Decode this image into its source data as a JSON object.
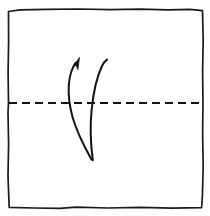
{
  "diagram": {
    "title": "Origami valley fold step",
    "type": "origami-fold-instruction",
    "canvas": {
      "width": 210,
      "height": 216,
      "background_color": "#ffffff"
    },
    "ink_color": "#141414",
    "paper": {
      "name": "square-sheet",
      "description": "Hand-drawn square sheet of paper",
      "fill_color": "#ffffff",
      "stroke_color": "#1a1a1a",
      "stroke_width": 1.7,
      "outline_path": "M 8.5 11.5 L 20 9.8 L 46 9.4 L 78 9.0 L 110 9.6 L 140 9.2 L 168 9.8 L 190 9.4 L 202.5 10.6 L 203.2 40 L 202.6 72 L 203.0 103 L 202.6 134 L 203.2 166 L 202.4 196 L 201.6 207.6 L 172 208.2 L 140 207.4 L 108 208.0 L 76 207.2 L 60 208.4 L 34 208.0 L 9.2 207.4 L 8.0 176 L 8.6 144 L 8.0 112 L 8.5 103 L 8.1 72 L 8.6 42 L 8.5 11.5 Z"
    },
    "crease": {
      "name": "horizontal-fold-crease",
      "style": "dashed",
      "description": "Dashed horizontal crease line marking the fold axis",
      "y_position": 103,
      "x_start": 9,
      "x_end": 203,
      "dash_length": 8,
      "gap_length": 5,
      "stroke_color": "#141414",
      "stroke_width": 1.9
    },
    "arrows": [
      {
        "name": "fold-arrow-left",
        "description": "Curved arrow sweeping upward with arrowhead indicating fold direction",
        "has_arrowhead": true,
        "stroke_width": 2.0,
        "path": "M 91.5 159.5 C 84 146 76.5 131 72.5 117 C 69.5 106 68.2 95 68.8 85 C 69.4 76 71.8 68.5 75.6 62.8",
        "arrowhead_points": "79.6 57.2 73.0 66.4 76.2 65.4 77.9 69.9",
        "tip": {
          "x": 79.6,
          "y": 57.2
        },
        "tail": {
          "x": 91.5,
          "y": 159.5
        }
      },
      {
        "name": "fold-arrow-right",
        "description": "Curved companion line sweeping upward without arrowhead",
        "has_arrowhead": false,
        "stroke_width": 2.0,
        "path": "M 92.8 160.2 C 90.6 144 90.0 126 91.6 110 C 93.4 92 96.8 76.8 102.0 66.0 C 103.6 62.8 105.3 60.8 107.0 59.6",
        "tail": {
          "x": 92.8,
          "y": 160.2
        },
        "free_end": {
          "x": 107.0,
          "y": 59.6
        }
      }
    ]
  }
}
